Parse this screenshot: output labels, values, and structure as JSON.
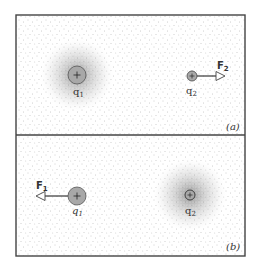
{
  "figure": {
    "panels": [
      {
        "id": "a",
        "label": "(a)",
        "charges": [
          {
            "name": "q1",
            "label": "q",
            "sub": "1",
            "sign": "+",
            "cx": 77,
            "cy": 75,
            "r": 9,
            "field_halo": true
          },
          {
            "name": "q2",
            "label": "q",
            "sub": "2",
            "sign": "+",
            "cx": 192,
            "cy": 76,
            "r": 5,
            "field_halo": false
          }
        ],
        "force": {
          "label": "F",
          "sub": "2",
          "direction": "right",
          "on": "q2"
        }
      },
      {
        "id": "b",
        "label": "(b)",
        "charges": [
          {
            "name": "q1",
            "label": "q",
            "sub": "1",
            "sign": "+",
            "cx": 77,
            "cy": 196,
            "r": 9,
            "field_halo": false
          },
          {
            "name": "q2",
            "label": "q",
            "sub": "2",
            "sign": "+",
            "cx": 190,
            "cy": 195,
            "r": 5,
            "field_halo": true
          }
        ],
        "force": {
          "label": "F",
          "sub": "1",
          "direction": "left",
          "on": "q1"
        }
      }
    ],
    "colors": {
      "border": "#444444",
      "charge_fill": "#a8a8a8",
      "dots": "#9a9a9a"
    }
  }
}
